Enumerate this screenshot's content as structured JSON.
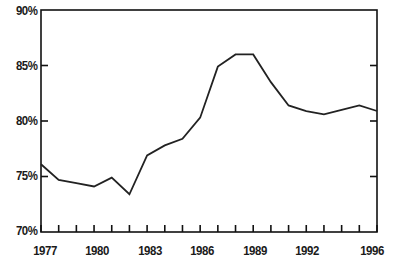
{
  "chart_data": {
    "type": "line",
    "title": "",
    "subtitle": "",
    "xlabel": "",
    "ylabel": "",
    "grid": false,
    "legend": null,
    "xlim": [
      1977,
      1996
    ],
    "ylim": [
      70,
      90
    ],
    "y_ticks": [
      70,
      75,
      80,
      85,
      90
    ],
    "y_tick_labels": [
      "70%",
      "75%",
      "80%",
      "85%",
      "90%"
    ],
    "x_ticks": [
      1977,
      1978,
      1979,
      1980,
      1981,
      1982,
      1983,
      1984,
      1985,
      1986,
      1987,
      1988,
      1989,
      1990,
      1991,
      1992,
      1993,
      1994,
      1995,
      1996
    ],
    "x_tick_labels_shown": [
      "1977",
      "1980",
      "1983",
      "1986",
      "1989",
      "1992",
      "1996"
    ],
    "x_labeled_years": [
      1977,
      1980,
      1983,
      1986,
      1989,
      1992,
      1996
    ],
    "x": [
      1977,
      1978,
      1979,
      1980,
      1981,
      1982,
      1983,
      1984,
      1985,
      1986,
      1987,
      1988,
      1989,
      1990,
      1991,
      1992,
      1993,
      1994,
      1995,
      1996
    ],
    "values": [
      76.1,
      74.7,
      74.4,
      74.1,
      74.9,
      73.4,
      76.9,
      77.8,
      78.4,
      80.3,
      84.9,
      86.0,
      86.0,
      83.5,
      81.4,
      80.9,
      80.6,
      81.0,
      81.4,
      80.9
    ],
    "series": [
      {
        "name": "series-1",
        "color": "#222222",
        "values": [
          76.1,
          74.7,
          74.4,
          74.1,
          74.9,
          73.4,
          76.9,
          77.8,
          78.4,
          80.3,
          84.9,
          86.0,
          86.0,
          83.5,
          81.4,
          80.9,
          80.6,
          81.0,
          81.4,
          80.9
        ]
      }
    ],
    "line_color": "#222222",
    "line_width": 1.8,
    "axis_color": "#111111",
    "background": "#ffffff"
  }
}
